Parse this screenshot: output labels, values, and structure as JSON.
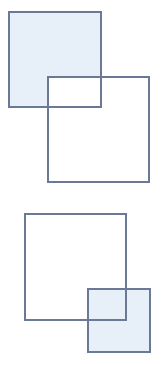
{
  "colors": {
    "stroke": "#6b7896",
    "fill": "#e7eff8",
    "background": "#ffffff"
  },
  "groups": [
    {
      "name": "top-pair",
      "shapes": [
        {
          "id": "square-a",
          "x": 9,
          "y": 12,
          "w": 92,
          "h": 95,
          "filled": true
        },
        {
          "id": "square-b",
          "x": 48,
          "y": 77,
          "w": 101,
          "h": 105,
          "filled": false
        }
      ]
    },
    {
      "name": "bottom-pair",
      "shapes": [
        {
          "id": "square-c",
          "x": 25,
          "y": 214,
          "w": 101,
          "h": 106,
          "filled": false
        },
        {
          "id": "square-d",
          "x": 88,
          "y": 289,
          "w": 62,
          "h": 63,
          "filled": true
        }
      ]
    }
  ]
}
